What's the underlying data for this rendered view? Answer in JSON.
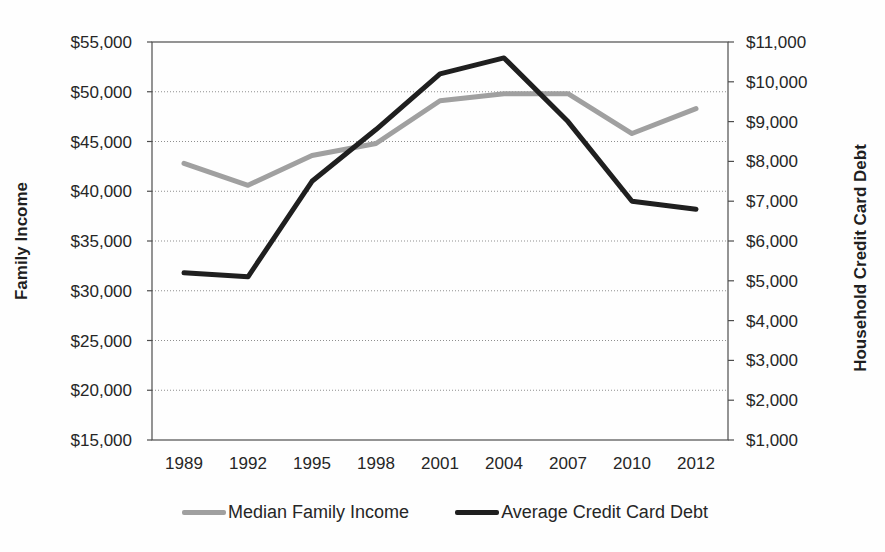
{
  "chart_data": {
    "type": "line",
    "title": "",
    "categories": [
      "1989",
      "1992",
      "1995",
      "1998",
      "2001",
      "2004",
      "2007",
      "2010",
      "2012"
    ],
    "series": [
      {
        "name": "Median Family Income",
        "axis": "left",
        "color": "#a0a0a0",
        "values": [
          42800,
          40600,
          43600,
          44800,
          49100,
          49800,
          49800,
          45800,
          48300
        ]
      },
      {
        "name": "Average Credit Card Debt",
        "axis": "right",
        "color": "#1f1f1f",
        "values": [
          5200,
          5100,
          7500,
          8800,
          10200,
          10600,
          9000,
          7000,
          6800
        ]
      }
    ],
    "left_axis": {
      "label": "Family Income",
      "min": 15000,
      "max": 55000,
      "step": 5000,
      "tick_labels": [
        "$15,000",
        "$20,000",
        "$25,000",
        "$30,000",
        "$35,000",
        "$40,000",
        "$45,000",
        "$50,000",
        "$55,000"
      ]
    },
    "right_axis": {
      "label": "Household Credit Card Debt",
      "min": 1000,
      "max": 11000,
      "step": 1000,
      "tick_labels": [
        "$1,000",
        "$2,000",
        "$3,000",
        "$4,000",
        "$5,000",
        "$6,000",
        "$7,000",
        "$8,000",
        "$9,000",
        "$10,000",
        "$11,000"
      ]
    },
    "legend_position": "bottom",
    "grid": true
  }
}
